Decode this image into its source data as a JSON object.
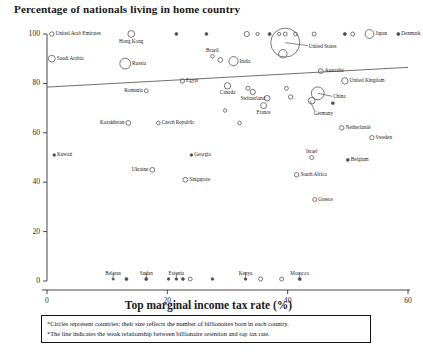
{
  "chart_data": {
    "type": "scatter",
    "title": "Percentage of nationals living in home country",
    "xlabel": "Top marginal income tax rate (%)",
    "ylabel": "Percentage of nationals living in home country",
    "xlim": [
      0,
      60
    ],
    "ylim": [
      0,
      100
    ],
    "xticks": [
      "0",
      "20",
      "40",
      "60"
    ],
    "yticks": [
      "0",
      "20",
      "40",
      "60",
      "80",
      "100"
    ],
    "grid": false,
    "legend": "none",
    "bubble_meaning": "Circle size reflects the number of billionaires born in each country",
    "trendline": {
      "x0": 0,
      "y0": 78.5,
      "x1": 60,
      "y1": 86.5,
      "note": "weak positive relationship"
    },
    "points": [
      {
        "label": "United Arab Emirates",
        "x": 0.8,
        "y": 100,
        "r": 2.2,
        "label_pos": "right"
      },
      {
        "label": "Saudi Arabia",
        "x": 0.8,
        "y": 90,
        "r": 3.4,
        "label_pos": "right"
      },
      {
        "label": "Hong Kong",
        "x": 14.0,
        "y": 100,
        "r": 3.4,
        "label_pos": "below"
      },
      {
        "label": "",
        "x": 21.5,
        "y": 100,
        "r": 1.4,
        "label_pos": "none"
      },
      {
        "label": "",
        "x": 26.5,
        "y": 100,
        "r": 1.4,
        "label_pos": "none"
      },
      {
        "label": "",
        "x": 33.2,
        "y": 100,
        "r": 2.6,
        "label_pos": "none"
      },
      {
        "label": "",
        "x": 35.0,
        "y": 100,
        "r": 1.6,
        "label_pos": "none"
      },
      {
        "label": "",
        "x": 37.0,
        "y": 100,
        "r": 1.5,
        "label_pos": "none"
      },
      {
        "label": "",
        "x": 38.6,
        "y": 100,
        "r": 1.6,
        "label_pos": "none"
      },
      {
        "label": "",
        "x": 39.6,
        "y": 100,
        "r": 2.0,
        "label_pos": "none"
      },
      {
        "label": "",
        "x": 41.3,
        "y": 100,
        "r": 1.9,
        "label_pos": "none"
      },
      {
        "label": "",
        "x": 44.4,
        "y": 100,
        "r": 2.0,
        "label_pos": "none"
      },
      {
        "label": "",
        "x": 49.5,
        "y": 100,
        "r": 1.5,
        "label_pos": "none"
      },
      {
        "label": "",
        "x": 50.8,
        "y": 100,
        "r": 2.0,
        "label_pos": "none"
      },
      {
        "label": "Japan",
        "x": 53.6,
        "y": 100,
        "r": 4.4,
        "label_pos": "right"
      },
      {
        "label": "Denmark",
        "x": 58.4,
        "y": 100,
        "r": 1.5,
        "label_pos": "right"
      },
      {
        "label": "United States",
        "x": 39.6,
        "y": 96.5,
        "r": 14.5,
        "label_pos": "leader-right"
      },
      {
        "label": "",
        "x": 39.2,
        "y": 92,
        "r": 4.2,
        "label_pos": "none"
      },
      {
        "label": "Russia",
        "x": 13.0,
        "y": 88,
        "r": 5.4,
        "label_pos": "right"
      },
      {
        "label": "Brazil",
        "x": 27.5,
        "y": 91,
        "r": 1.8,
        "label_pos": "above"
      },
      {
        "label": "",
        "x": 28.8,
        "y": 89.5,
        "r": 2.4,
        "label_pos": "none"
      },
      {
        "label": "India",
        "x": 31.0,
        "y": 89,
        "r": 4.6,
        "label_pos": "right"
      },
      {
        "label": "Australia",
        "x": 45.5,
        "y": 85,
        "r": 2.4,
        "label_pos": "right"
      },
      {
        "label": "United Kingdom",
        "x": 49.5,
        "y": 81,
        "r": 3.2,
        "label_pos": "right"
      },
      {
        "label": "Egypt",
        "x": 22.5,
        "y": 81,
        "r": 2.2,
        "label_pos": "right"
      },
      {
        "label": "Canada",
        "x": 30.0,
        "y": 79,
        "r": 3.2,
        "label_pos": "below"
      },
      {
        "label": "Romania",
        "x": 16.5,
        "y": 77,
        "r": 1.9,
        "label_pos": "left"
      },
      {
        "label": "Switzerland",
        "x": 34.2,
        "y": 76.5,
        "r": 2.6,
        "label_pos": "below"
      },
      {
        "label": "",
        "x": 33.4,
        "y": 78,
        "r": 2.0,
        "label_pos": "none"
      },
      {
        "label": "China",
        "x": 45.0,
        "y": 76,
        "r": 6.4,
        "label_pos": "leader-right"
      },
      {
        "label": "Germany",
        "x": 44.0,
        "y": 73,
        "r": 3.4,
        "label_pos": "leader-below"
      },
      {
        "label": "",
        "x": 39.8,
        "y": 78,
        "r": 1.9,
        "label_pos": "none"
      },
      {
        "label": "",
        "x": 40.5,
        "y": 74.5,
        "r": 2.2,
        "label_pos": "none"
      },
      {
        "label": "France",
        "x": 36.0,
        "y": 71,
        "r": 3.0,
        "label_pos": "below"
      },
      {
        "label": "",
        "x": 36.6,
        "y": 74,
        "r": 2.8,
        "label_pos": "none"
      },
      {
        "label": "",
        "x": 29.6,
        "y": 69,
        "r": 1.7,
        "label_pos": "none"
      },
      {
        "label": "",
        "x": 47.5,
        "y": 72,
        "r": 1.4,
        "label_pos": "none"
      },
      {
        "label": "Czech Republic",
        "x": 18.5,
        "y": 64,
        "r": 1.8,
        "label_pos": "right"
      },
      {
        "label": "Kazakhstan",
        "x": 13.5,
        "y": 64,
        "r": 2.4,
        "label_pos": "left"
      },
      {
        "label": "",
        "x": 32.0,
        "y": 64,
        "r": 1.8,
        "label_pos": "none"
      },
      {
        "label": "Netherlands",
        "x": 49.0,
        "y": 62,
        "r": 2.2,
        "label_pos": "right"
      },
      {
        "label": "Sweden",
        "x": 54.0,
        "y": 58,
        "r": 2.2,
        "label_pos": "right"
      },
      {
        "label": "Kuwait",
        "x": 1.2,
        "y": 51,
        "r": 1.3,
        "label_pos": "right"
      },
      {
        "label": "Georgia",
        "x": 24.0,
        "y": 51,
        "r": 1.3,
        "label_pos": "right"
      },
      {
        "label": "Israel",
        "x": 44.0,
        "y": 50,
        "r": 2.0,
        "label_pos": "above"
      },
      {
        "label": "Belgium",
        "x": 50.0,
        "y": 49,
        "r": 1.4,
        "label_pos": "right"
      },
      {
        "label": "Ukraine",
        "x": 17.5,
        "y": 45,
        "r": 2.4,
        "label_pos": "left"
      },
      {
        "label": "Singapore",
        "x": 23.0,
        "y": 41,
        "r": 2.4,
        "label_pos": "right"
      },
      {
        "label": "South Africa",
        "x": 41.5,
        "y": 43,
        "r": 2.2,
        "label_pos": "right"
      },
      {
        "label": "Greece",
        "x": 44.5,
        "y": 33,
        "r": 2.0,
        "label_pos": "right"
      },
      {
        "label": "Belarus",
        "x": 11.0,
        "y": 0.8,
        "r": 1.1,
        "label_pos": "above"
      },
      {
        "label": "",
        "x": 13.2,
        "y": 0.8,
        "r": 1.5,
        "label_pos": "none"
      },
      {
        "label": "Sudan",
        "x": 16.5,
        "y": 0.8,
        "r": 1.5,
        "label_pos": "above"
      },
      {
        "label": "",
        "x": 20.2,
        "y": 0.8,
        "r": 1.3,
        "label_pos": "none"
      },
      {
        "label": "Estonia",
        "x": 21.5,
        "y": 0.8,
        "r": 1.3,
        "label_pos": "above"
      },
      {
        "label": "",
        "x": 22.6,
        "y": 0.8,
        "r": 1.4,
        "label_pos": "none"
      },
      {
        "label": "",
        "x": 23.8,
        "y": 0.8,
        "r": 2.0,
        "label_pos": "none"
      },
      {
        "label": "",
        "x": 27.5,
        "y": 0.8,
        "r": 1.3,
        "label_pos": "none"
      },
      {
        "label": "Kenya",
        "x": 33.0,
        "y": 0.8,
        "r": 1.3,
        "label_pos": "above"
      },
      {
        "label": "",
        "x": 35.5,
        "y": 0.8,
        "r": 2.0,
        "label_pos": "none"
      },
      {
        "label": "",
        "x": 39.0,
        "y": 0.8,
        "r": 2.0,
        "label_pos": "none"
      },
      {
        "label": "Morocco",
        "x": 42.0,
        "y": 0.8,
        "r": 1.5,
        "label_pos": "above"
      }
    ]
  },
  "caption": {
    "line1": "*Circles represent countries; their size reflects the number of billionaires born in each country.",
    "line2": "*The line indicates the weak relationship between billionaire retention and top tax rate."
  },
  "colors": {
    "axis": "#333333",
    "marker_stroke": "#555555",
    "trendline": "#555555",
    "text": "#1a1a1a",
    "background": "#ffffff"
  }
}
